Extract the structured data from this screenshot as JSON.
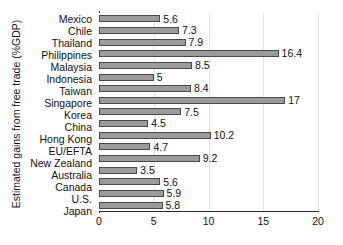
{
  "chart_data": {
    "type": "bar",
    "orientation": "horizontal",
    "title": "",
    "xlabel": "",
    "ylabel": "Estimated gains from free trade (%GDP)",
    "xlim": [
      0,
      20
    ],
    "xticks": [
      0,
      5,
      10,
      15,
      20
    ],
    "xtick_labels": [
      "0",
      "5",
      "10",
      "15",
      "20"
    ],
    "grid": "vertical",
    "legend": "none",
    "categories": [
      "Mexico",
      "Chile",
      "Thailand",
      "Philippines",
      "Malaysia",
      "Indonesia",
      "Taiwan",
      "Singapore",
      "Korea",
      "China",
      "Hong Kong",
      "EU/EFTA",
      "New Zealand",
      "Australia",
      "Canada",
      "U.S.",
      "Japan"
    ],
    "values": [
      5.6,
      7.3,
      7.9,
      16.4,
      8.5,
      5,
      8.4,
      17,
      7.5,
      4.5,
      10.2,
      4.7,
      9.2,
      3.5,
      5.6,
      5.9,
      5.8
    ],
    "value_labels": [
      "5.6",
      "7.3",
      "7.9",
      "16.4",
      "8.5",
      "5",
      "8.4",
      "17",
      "7.5",
      "4.5",
      "10.2",
      "4.7",
      "9.2",
      "3.5",
      "5.6",
      "5.9",
      "5.8"
    ],
    "colors": {
      "bar_fill": "#9b9b9b",
      "bar_edge": "#4a4a4a",
      "axis": "#2b2b2b",
      "grid": "#e3e3e3",
      "text": "#111111",
      "background": "#ffffff"
    }
  }
}
